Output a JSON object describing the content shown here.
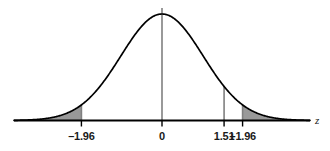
{
  "chart_data": {
    "type": "line",
    "title": "",
    "subtitle": "",
    "xlabel": "z",
    "ylabel": "",
    "grid": false,
    "legend": null,
    "xlim": [
      -3.6,
      3.6
    ],
    "ylim": [
      0,
      0.45
    ],
    "distribution": "standard normal (mean 0, sd 1)",
    "curve_description": "Standard normal probability density curve drawn as a black bell-shaped line over a horizontal z axis.",
    "x": [
      -3.6,
      -3.4,
      -3.2,
      -3.0,
      -2.8,
      -2.6,
      -2.4,
      -2.2,
      -2.0,
      -1.96,
      -1.8,
      -1.6,
      -1.4,
      -1.2,
      -1.0,
      -0.8,
      -0.6,
      -0.4,
      -0.2,
      0.0,
      0.2,
      0.4,
      0.6,
      0.8,
      1.0,
      1.2,
      1.4,
      1.51,
      1.6,
      1.8,
      1.96,
      2.0,
      2.2,
      2.4,
      2.6,
      2.8,
      3.0,
      3.2,
      3.4,
      3.6
    ],
    "y": [
      0.0006,
      0.0012,
      0.0024,
      0.0044,
      0.0079,
      0.0136,
      0.0224,
      0.0355,
      0.054,
      0.0584,
      0.079,
      0.1109,
      0.1497,
      0.1942,
      0.242,
      0.2897,
      0.3332,
      0.3683,
      0.391,
      0.3989,
      0.391,
      0.3683,
      0.3332,
      0.2897,
      0.242,
      0.1942,
      0.1497,
      0.1276,
      0.1109,
      0.079,
      0.0584,
      0.054,
      0.0355,
      0.0224,
      0.0136,
      0.0079,
      0.0044,
      0.0024,
      0.0012,
      0.0006
    ],
    "ticks": [
      {
        "value": -1.96,
        "label": "–1.96",
        "has_vertical_line": true,
        "line_color": "#808080"
      },
      {
        "value": 0,
        "label": "0",
        "has_vertical_line": true,
        "line_color": "#808080"
      },
      {
        "value": 1.51,
        "label": "1.51",
        "has_vertical_line": true,
        "line_color": "#808080"
      },
      {
        "value": 1.96,
        "label": "+1.96",
        "has_vertical_line": true,
        "line_color": "#808080"
      }
    ],
    "shaded_regions": [
      {
        "name": "left-tail",
        "from": -3.6,
        "to": -1.96,
        "fill": "#999999",
        "label": ""
      },
      {
        "name": "right-tail",
        "from": 1.96,
        "to": 3.6,
        "fill": "#999999",
        "label": ""
      }
    ],
    "annotations": []
  },
  "colors": {
    "background": "#ffffff",
    "curve": "#000000",
    "axis": "#000000",
    "shade": "#999999",
    "vertical_line": "#808080",
    "text": "#1a1a1a"
  },
  "labels": {
    "tick_minus_196": "–1.96",
    "tick_zero": "0",
    "tick_151": "1.51",
    "tick_plus_196": "+1.96",
    "axis_z": "z"
  }
}
